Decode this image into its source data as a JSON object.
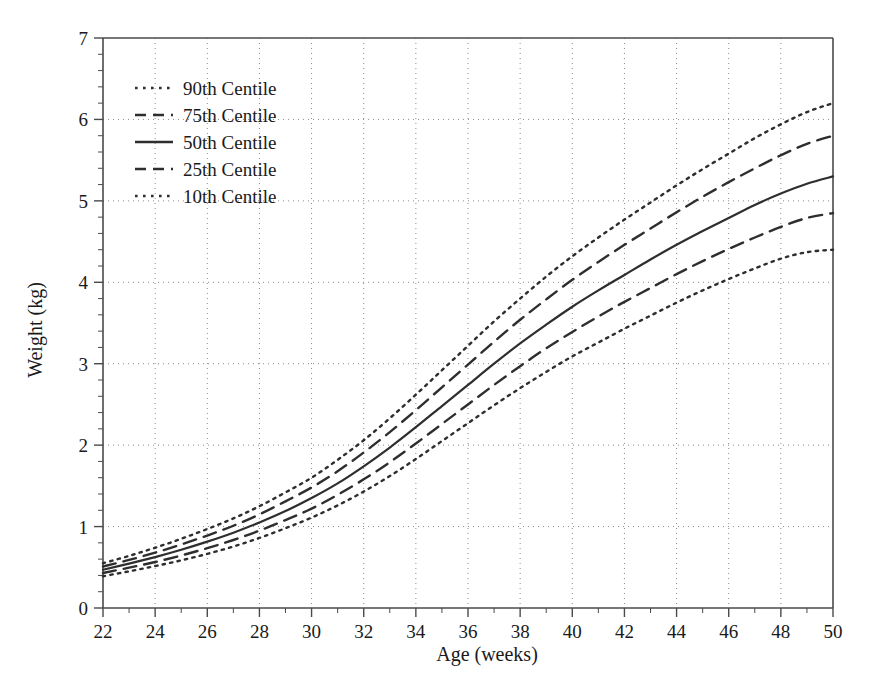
{
  "chart_data": {
    "type": "line",
    "title": "",
    "xlabel": "Age (weeks)",
    "ylabel": "Weight (kg)",
    "xlim": [
      22,
      50
    ],
    "ylim": [
      0,
      7
    ],
    "grid": true,
    "legend_position": "top-left",
    "x_ticks": [
      22,
      24,
      26,
      28,
      30,
      32,
      34,
      36,
      38,
      40,
      42,
      44,
      46,
      48,
      50
    ],
    "x_tick_labels": [
      "22",
      "24",
      "26",
      "28",
      "30",
      "32",
      "34",
      "36",
      "38",
      "40",
      "42",
      "44",
      "46",
      "48",
      "50"
    ],
    "x_minor_step": 1,
    "y_ticks": [
      0,
      1,
      2,
      3,
      4,
      5,
      6,
      7
    ],
    "y_tick_labels": [
      "0",
      "1",
      "2",
      "3",
      "4",
      "5",
      "6",
      "7"
    ],
    "y_minor_step": 0.2,
    "x": [
      22,
      23,
      24,
      25,
      26,
      27,
      28,
      29,
      30,
      31,
      32,
      33,
      34,
      35,
      36,
      37,
      38,
      39,
      40,
      41,
      42,
      43,
      44,
      45,
      46,
      47,
      48,
      49,
      50
    ],
    "series": [
      {
        "name": "90th Centile",
        "style": "dotted",
        "color": "#2e2e2e",
        "values": [
          0.55,
          0.64,
          0.74,
          0.85,
          0.97,
          1.1,
          1.25,
          1.42,
          1.6,
          1.82,
          2.06,
          2.33,
          2.62,
          2.92,
          3.22,
          3.52,
          3.8,
          4.07,
          4.32,
          4.55,
          4.77,
          4.98,
          5.19,
          5.39,
          5.58,
          5.77,
          5.94,
          6.09,
          6.2
        ]
      },
      {
        "name": "75th Centile",
        "style": "dashed",
        "color": "#2e2e2e",
        "values": [
          0.51,
          0.59,
          0.68,
          0.78,
          0.89,
          1.01,
          1.15,
          1.31,
          1.48,
          1.68,
          1.91,
          2.16,
          2.43,
          2.71,
          2.99,
          3.27,
          3.54,
          3.79,
          4.03,
          4.25,
          4.46,
          4.66,
          4.86,
          5.05,
          5.23,
          5.4,
          5.56,
          5.7,
          5.8
        ]
      },
      {
        "name": "50th Centile",
        "style": "solid",
        "color": "#2e2e2e",
        "values": [
          0.47,
          0.545,
          0.625,
          0.715,
          0.815,
          0.925,
          1.05,
          1.19,
          1.35,
          1.53,
          1.74,
          1.97,
          2.22,
          2.48,
          2.74,
          3.0,
          3.25,
          3.48,
          3.7,
          3.9,
          4.09,
          4.28,
          4.46,
          4.63,
          4.79,
          4.95,
          5.09,
          5.21,
          5.3
        ]
      },
      {
        "name": "25th Centile",
        "style": "dashed",
        "color": "#2e2e2e",
        "values": [
          0.43,
          0.495,
          0.565,
          0.645,
          0.735,
          0.835,
          0.95,
          1.08,
          1.22,
          1.39,
          1.58,
          1.79,
          2.02,
          2.26,
          2.5,
          2.74,
          2.97,
          3.19,
          3.39,
          3.58,
          3.76,
          3.93,
          4.1,
          4.26,
          4.41,
          4.55,
          4.68,
          4.79,
          4.85
        ]
      },
      {
        "name": "10th Centile",
        "style": "dotted",
        "color": "#2e2e2e",
        "values": [
          0.39,
          0.45,
          0.515,
          0.585,
          0.665,
          0.755,
          0.86,
          0.98,
          1.11,
          1.26,
          1.43,
          1.62,
          1.83,
          2.05,
          2.27,
          2.49,
          2.7,
          2.9,
          3.09,
          3.26,
          3.43,
          3.59,
          3.75,
          3.9,
          4.04,
          4.17,
          4.29,
          4.37,
          4.4
        ]
      }
    ]
  },
  "legend": {
    "entries": [
      {
        "label": "90th Centile"
      },
      {
        "label": "75th Centile"
      },
      {
        "label": "50th Centile"
      },
      {
        "label": "25th Centile"
      },
      {
        "label": "10th Centile"
      }
    ]
  }
}
